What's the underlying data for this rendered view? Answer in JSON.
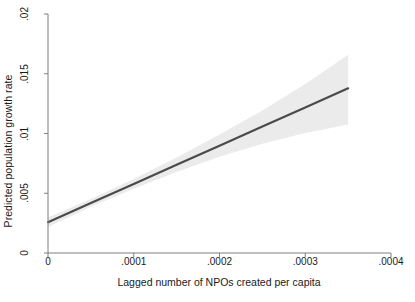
{
  "chart_data": {
    "type": "line",
    "title": "",
    "subtitle": "",
    "xlabel": "Lagged number of NPOs created per capita",
    "ylabel": "Predicted population growth rate",
    "xlim": [
      0,
      0.0004
    ],
    "ylim": [
      0,
      0.02
    ],
    "xticks": [
      0,
      0.0001,
      0.0002,
      0.0003,
      0.0004
    ],
    "xticklabels": [
      "0",
      ".0001",
      ".0002",
      ".0003",
      ".0004"
    ],
    "yticks": [
      0,
      0.005,
      0.01,
      0.015,
      0.02
    ],
    "yticklabels": [
      "0",
      ".005",
      ".01",
      ".015",
      ".02"
    ],
    "grid": false,
    "legend": null,
    "series": [
      {
        "name": "Predicted population growth rate",
        "kind": "line",
        "color": "#4a4a4a",
        "x": [
          0,
          5e-05,
          0.0001,
          0.00015,
          0.0002,
          0.00025,
          0.0003,
          0.00035
        ],
        "values": [
          0.00258,
          0.00418,
          0.00578,
          0.00738,
          0.00898,
          0.01058,
          0.01218,
          0.01378
        ]
      },
      {
        "name": "95% confidence interval",
        "kind": "band",
        "color": "#ebebeb",
        "x": [
          0,
          5e-05,
          0.0001,
          0.00015,
          0.0002,
          0.00025,
          0.0003,
          0.00035
        ],
        "lower": [
          0.00218,
          0.00388,
          0.00538,
          0.00678,
          0.00805,
          0.00915,
          0.01005,
          0.01075
        ],
        "upper": [
          0.00298,
          0.00452,
          0.0062,
          0.008,
          0.00992,
          0.01192,
          0.01415,
          0.0166
        ]
      }
    ]
  },
  "axes": {
    "axis_color": "#7f7f7f",
    "tick_color": "#7f7f7f",
    "text_color": "#1a1a1a",
    "background": "#ffffff"
  }
}
